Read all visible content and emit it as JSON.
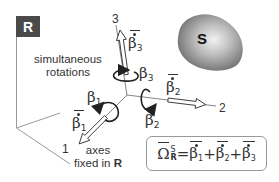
{
  "diagram": {
    "reference_frame": {
      "label": "R",
      "box_color": "#4a4a4a"
    },
    "body": {
      "label": "S",
      "color": "#8c8c8c"
    },
    "caption_top": {
      "line1": "simultaneous",
      "line2": "rotations"
    },
    "caption_bottom": {
      "line1": "axes",
      "line2_prefix": "fixed in ",
      "line2_bold": "R"
    },
    "axes": [
      {
        "id": "1",
        "label": "1"
      },
      {
        "id": "2",
        "label": "2"
      },
      {
        "id": "3",
        "label": "3"
      }
    ],
    "rotation_labels": {
      "beta1": {
        "symbol": "β",
        "sub": "1"
      },
      "beta2": {
        "symbol": "β",
        "sub": "2"
      },
      "beta3": {
        "symbol": "β",
        "sub": "3"
      }
    },
    "rate_vectors": {
      "beta1_dot": {
        "symbol": "β",
        "sub": "1"
      },
      "beta2_dot": {
        "symbol": "β",
        "sub": "2"
      },
      "beta3_dot": {
        "symbol": "β",
        "sub": "3"
      }
    },
    "formula": {
      "lhs_symbol": "Ω",
      "lhs_sup": "S",
      "lhs_sub": "R",
      "equals": "=",
      "plus": "+",
      "terms": [
        {
          "symbol": "β",
          "sub": "1"
        },
        {
          "symbol": "β",
          "sub": "2"
        },
        {
          "symbol": "β",
          "sub": "3"
        }
      ]
    }
  }
}
